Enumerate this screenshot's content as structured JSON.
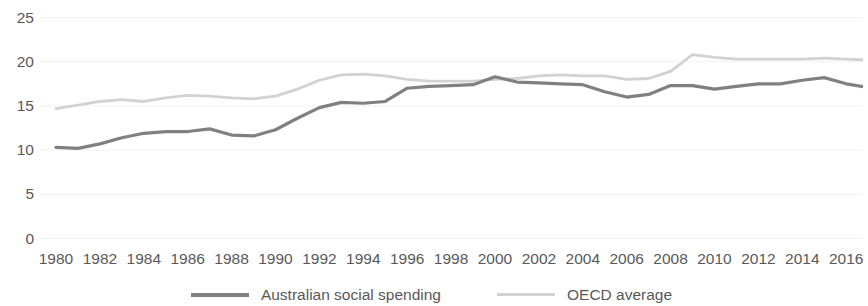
{
  "chart_data": {
    "type": "line",
    "title": "",
    "subtitle": "",
    "xlabel": "",
    "ylabel": "",
    "xlim": [
      1980,
      2017
    ],
    "ylim": [
      0,
      25
    ],
    "grid": true,
    "legend_position": "bottom",
    "y_ticks": [
      25,
      20,
      15,
      10,
      5,
      0
    ],
    "x_ticks": [
      1980,
      1982,
      1984,
      1986,
      1988,
      1990,
      1992,
      1994,
      1996,
      1998,
      2000,
      2002,
      2004,
      2006,
      2008,
      2010,
      2012,
      2014,
      2016
    ],
    "x": [
      1980,
      1981,
      1982,
      1983,
      1984,
      1985,
      1986,
      1987,
      1988,
      1989,
      1990,
      1991,
      1992,
      1993,
      1994,
      1995,
      1996,
      1997,
      1998,
      1999,
      2000,
      2001,
      2002,
      2003,
      2004,
      2005,
      2006,
      2007,
      2008,
      2009,
      2010,
      2011,
      2012,
      2013,
      2014,
      2015,
      2016,
      2017
    ],
    "series": [
      {
        "name": "Australian social spending",
        "color": "#808080",
        "width": 3.2,
        "values": [
          10.3,
          10.2,
          10.7,
          11.4,
          11.9,
          12.1,
          12.1,
          12.4,
          11.7,
          11.6,
          12.3,
          13.6,
          14.8,
          15.4,
          15.3,
          15.5,
          17.0,
          17.2,
          17.3,
          17.4,
          18.3,
          17.7,
          17.6,
          17.5,
          17.4,
          16.6,
          16.0,
          16.3,
          17.3,
          17.3,
          16.9,
          17.2,
          17.5,
          17.5,
          17.9,
          18.2,
          17.5,
          17.1
        ]
      },
      {
        "name": "OECD average",
        "color": "#d2d2d2",
        "width": 2.8,
        "values": [
          14.7,
          15.1,
          15.5,
          15.7,
          15.5,
          15.9,
          16.2,
          16.1,
          15.9,
          15.8,
          16.1,
          16.9,
          17.9,
          18.5,
          18.6,
          18.4,
          18.0,
          17.8,
          17.8,
          17.8,
          18.0,
          18.1,
          18.4,
          18.5,
          18.4,
          18.4,
          18.0,
          18.1,
          18.9,
          20.8,
          20.5,
          20.3,
          20.3,
          20.3,
          20.3,
          20.4,
          20.3,
          20.2
        ]
      }
    ]
  },
  "legend": {
    "entries": [
      {
        "label": "Australian social spending"
      },
      {
        "label": "OECD average"
      }
    ]
  }
}
